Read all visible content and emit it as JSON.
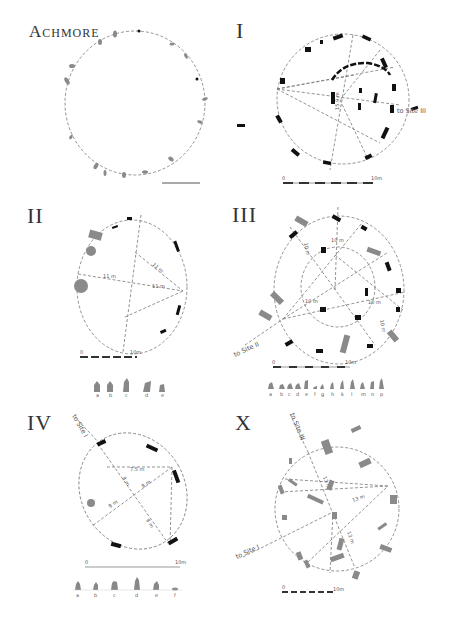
{
  "panels": {
    "achmore": {
      "title_big": "A",
      "title_rest": "CHMORE"
    },
    "site_i": {
      "title": "I",
      "measure": "15.9 m",
      "pointer": "to Site III",
      "scale_start": "0",
      "scale_end": "10m"
    },
    "site_ii": {
      "title": "II",
      "measures": [
        "11 m",
        "11 m",
        "11 m",
        "11 m"
      ],
      "scale_start": "0",
      "scale_end": "10m",
      "stone_labels": [
        "a",
        "b",
        "c",
        "d",
        "e"
      ]
    },
    "site_iii": {
      "title": "III",
      "measures": [
        "10 m",
        "10 m",
        "10 m",
        "10 m",
        "10 m"
      ],
      "pointer": "to Site II",
      "scale_start": "0",
      "scale_end": "10m",
      "stone_labels": [
        "a",
        "b",
        "c",
        "d",
        "e",
        "f",
        "g",
        "h",
        "k",
        "l",
        "m",
        "n",
        "p",
        "q"
      ]
    },
    "site_iv": {
      "title": "IV",
      "pointer": "to Site I",
      "measures": [
        "7.5 m",
        "8 m",
        "8 m",
        "8 m",
        "8 m"
      ],
      "scale_start": "0",
      "scale_end": "10m",
      "stone_labels": [
        "a",
        "b",
        "c",
        "d",
        "e",
        "f"
      ]
    },
    "site_x": {
      "title": "X",
      "pointer_top": "to Site III",
      "pointer_left": "to Site I",
      "measures": [
        "13 m",
        "13 m",
        "13 m"
      ],
      "scale_start": "0",
      "scale_end": "10m"
    }
  },
  "colors": {
    "stone_dark": "#111111",
    "stone_grey": "#8a8a8a",
    "line": "#777777",
    "text": "#333333"
  }
}
